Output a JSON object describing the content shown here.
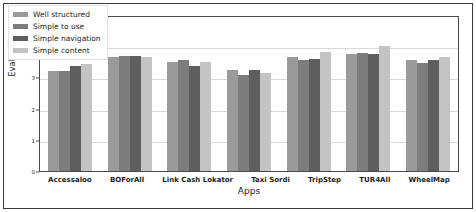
{
  "chart_data": {
    "type": "bar",
    "title": "",
    "xlabel": "Apps",
    "ylabel": "Evaluation",
    "ylim": [
      0,
      5
    ],
    "yticks": [
      0,
      1,
      2,
      3,
      4,
      5
    ],
    "grid": true,
    "legend_position": "upper-left",
    "categories": [
      "Accessaloo",
      "BOForAll",
      "Link Cash Lokator",
      "Taxi Sordi",
      "TripStep",
      "TUR4All",
      "WheelMap"
    ],
    "series": [
      {
        "name": "Well structured",
        "color": "#9a9a9a",
        "values": [
          3.2,
          3.65,
          3.5,
          3.25,
          3.65,
          3.75,
          3.55
        ]
      },
      {
        "name": "Simple to use",
        "color": "#7d7d7d",
        "values": [
          3.2,
          3.68,
          3.57,
          3.07,
          3.55,
          3.78,
          3.47
        ]
      },
      {
        "name": "Simple navigation",
        "color": "#5e5e5e",
        "values": [
          3.38,
          3.68,
          3.38,
          3.25,
          3.6,
          3.75,
          3.57
        ]
      },
      {
        "name": "Simple content",
        "color": "#c3c3c3",
        "values": [
          3.42,
          3.65,
          3.5,
          3.13,
          3.83,
          4.0,
          3.65
        ]
      }
    ]
  },
  "legend": {
    "items": [
      {
        "label": "Well structured",
        "color": "#9a9a9a"
      },
      {
        "label": "Simple to use",
        "color": "#7d7d7d"
      },
      {
        "label": "Simple navigation",
        "color": "#5e5e5e"
      },
      {
        "label": "Simple content",
        "color": "#c3c3c3"
      }
    ]
  },
  "axes": {
    "y_label": "Evaluation",
    "x_label": "Apps",
    "y_tick_labels": [
      "0",
      "1",
      "2",
      "3",
      "4",
      "5"
    ],
    "x_tick_labels": [
      "Accessaloo",
      "BOForAll",
      "Link Cash Lokator",
      "Taxi Sordi",
      "TripStep",
      "TUR4All",
      "WheelMap"
    ]
  },
  "colors": {
    "axis": "#4a4a4a",
    "grid": "#d8d8e4",
    "background": "#ffffff",
    "text": "#1d1d1d"
  }
}
